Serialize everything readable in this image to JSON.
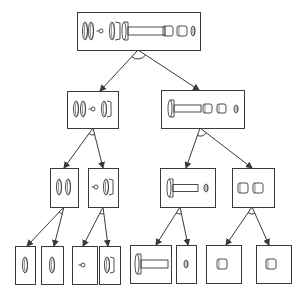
{
  "diagram": {
    "type": "assembly-decomposition-tree",
    "width": 304,
    "height": 293,
    "colors": {
      "stroke": "#3a3a3a",
      "background": "#ffffff"
    },
    "nodes": [
      {
        "id": "root",
        "level": 0,
        "x": 77,
        "y": 12,
        "w": 123,
        "h": 38,
        "parts": [
          {
            "kind": "ring",
            "cx": 85,
            "cy": 31,
            "rx": 2.5,
            "ry": 9
          },
          {
            "kind": "ring",
            "cx": 91,
            "cy": 31,
            "rx": 2.5,
            "ry": 9
          },
          {
            "kind": "dot-stem",
            "cx": 101,
            "cy": 31,
            "r": 2
          },
          {
            "kind": "ring",
            "cx": 112,
            "cy": 31,
            "rx": 2.5,
            "ry": 9
          },
          {
            "kind": "cap",
            "x": 115,
            "y": 22,
            "w": 5,
            "h": 18
          },
          {
            "kind": "bolt",
            "x": 122,
            "y": 22,
            "headW": 6,
            "h": 18,
            "shaftL": 37,
            "shaftH": 8
          },
          {
            "kind": "sleeve",
            "x": 163,
            "y": 26,
            "w": 10,
            "h": 10
          },
          {
            "kind": "sleeve",
            "x": 177,
            "y": 26,
            "w": 10,
            "h": 10
          },
          {
            "kind": "ring",
            "cx": 193,
            "cy": 31,
            "rx": 2,
            "ry": 5
          }
        ]
      },
      {
        "id": "left",
        "level": 1,
        "x": 67,
        "y": 91,
        "w": 51,
        "h": 37,
        "parts": [
          {
            "kind": "ring",
            "cx": 76,
            "cy": 109,
            "rx": 2.5,
            "ry": 8
          },
          {
            "kind": "ring",
            "cx": 83,
            "cy": 109,
            "rx": 2.5,
            "ry": 8
          },
          {
            "kind": "dot-stem",
            "cx": 93,
            "cy": 109,
            "r": 2
          },
          {
            "kind": "ring",
            "cx": 104,
            "cy": 109,
            "rx": 2.5,
            "ry": 8
          },
          {
            "kind": "cap",
            "x": 107,
            "y": 101,
            "w": 4,
            "h": 16
          }
        ]
      },
      {
        "id": "right",
        "level": 1,
        "x": 161,
        "y": 90,
        "w": 83,
        "h": 38,
        "parts": [
          {
            "kind": "bolt",
            "x": 168,
            "y": 100,
            "headW": 6,
            "h": 17,
            "shaftL": 27,
            "shaftH": 7
          },
          {
            "kind": "sleeve",
            "x": 203,
            "y": 104,
            "w": 9,
            "h": 9
          },
          {
            "kind": "sleeve",
            "x": 217,
            "y": 104,
            "w": 9,
            "h": 9
          },
          {
            "kind": "ring",
            "cx": 236,
            "cy": 109,
            "rx": 2,
            "ry": 4
          }
        ]
      },
      {
        "id": "left-a",
        "level": 2,
        "x": 50,
        "y": 168,
        "w": 28,
        "h": 39,
        "parts": [
          {
            "kind": "ring",
            "cx": 59,
            "cy": 187,
            "rx": 2.5,
            "ry": 8
          },
          {
            "kind": "ring",
            "cx": 68,
            "cy": 187,
            "rx": 2.5,
            "ry": 8
          }
        ]
      },
      {
        "id": "left-b",
        "level": 2,
        "x": 88,
        "y": 168,
        "w": 30,
        "h": 39,
        "parts": [
          {
            "kind": "dot-stem",
            "cx": 96,
            "cy": 187,
            "r": 2
          },
          {
            "kind": "ring",
            "cx": 106,
            "cy": 187,
            "rx": 2.5,
            "ry": 8
          },
          {
            "kind": "cap",
            "x": 109,
            "y": 179,
            "w": 4,
            "h": 16
          }
        ]
      },
      {
        "id": "right-c",
        "level": 2,
        "x": 160,
        "y": 168,
        "w": 55,
        "h": 39,
        "parts": [
          {
            "kind": "bolt",
            "x": 167,
            "y": 179,
            "headW": 6,
            "h": 18,
            "shaftL": 25,
            "shaftH": 7
          },
          {
            "kind": "ring",
            "cx": 206,
            "cy": 188,
            "rx": 2,
            "ry": 4
          }
        ]
      },
      {
        "id": "right-d",
        "level": 2,
        "x": 232,
        "y": 168,
        "w": 42,
        "h": 39,
        "parts": [
          {
            "kind": "sleeve",
            "x": 238,
            "y": 183,
            "w": 10,
            "h": 10
          },
          {
            "kind": "sleeve",
            "x": 253,
            "y": 183,
            "w": 10,
            "h": 10
          }
        ]
      },
      {
        "id": "leaf-1",
        "level": 3,
        "x": 15,
        "y": 246,
        "w": 20,
        "h": 38,
        "parts": [
          {
            "kind": "ring",
            "cx": 25,
            "cy": 265,
            "rx": 2.5,
            "ry": 8
          }
        ]
      },
      {
        "id": "leaf-2",
        "level": 3,
        "x": 41,
        "y": 246,
        "w": 22,
        "h": 38,
        "parts": [
          {
            "kind": "ring",
            "cx": 52,
            "cy": 265,
            "rx": 2.5,
            "ry": 8
          }
        ]
      },
      {
        "id": "leaf-3",
        "level": 3,
        "x": 72,
        "y": 246,
        "w": 25,
        "h": 38,
        "parts": [
          {
            "kind": "dot-stem",
            "cx": 83,
            "cy": 265,
            "r": 2
          }
        ]
      },
      {
        "id": "leaf-4",
        "level": 3,
        "x": 99,
        "y": 246,
        "w": 21,
        "h": 38,
        "parts": [
          {
            "kind": "ring",
            "cx": 107,
            "cy": 265,
            "rx": 2.5,
            "ry": 8
          },
          {
            "kind": "cap",
            "x": 110,
            "y": 257,
            "w": 4,
            "h": 16
          }
        ]
      },
      {
        "id": "leaf-5",
        "level": 3,
        "x": 130,
        "y": 245,
        "w": 41,
        "h": 38,
        "parts": [
          {
            "kind": "bolt",
            "x": 135,
            "y": 254,
            "headW": 6,
            "h": 20,
            "shaftL": 27,
            "shaftH": 8
          }
        ]
      },
      {
        "id": "leaf-6",
        "level": 3,
        "x": 176,
        "y": 245,
        "w": 20,
        "h": 38,
        "parts": [
          {
            "kind": "ring",
            "cx": 186,
            "cy": 264,
            "rx": 2,
            "ry": 4
          }
        ]
      },
      {
        "id": "leaf-7",
        "level": 3,
        "x": 206,
        "y": 245,
        "w": 35,
        "h": 38,
        "parts": [
          {
            "kind": "sleeve",
            "x": 217,
            "y": 259,
            "w": 10,
            "h": 10
          }
        ]
      },
      {
        "id": "leaf-8",
        "level": 3,
        "x": 256,
        "y": 245,
        "w": 35,
        "h": 38,
        "parts": [
          {
            "kind": "sleeve",
            "x": 266,
            "y": 259,
            "w": 10,
            "h": 10
          }
        ]
      }
    ],
    "edges": [
      {
        "from": "root",
        "to": "left",
        "x1": 138,
        "y1": 50,
        "x2": 100,
        "y2": 91
      },
      {
        "from": "root",
        "to": "right",
        "x1": 138,
        "y1": 50,
        "x2": 199,
        "y2": 90
      },
      {
        "from": "left",
        "to": "left-a",
        "x1": 93,
        "y1": 128,
        "x2": 64,
        "y2": 168
      },
      {
        "from": "left",
        "to": "left-b",
        "x1": 93,
        "y1": 128,
        "x2": 103,
        "y2": 168
      },
      {
        "from": "right",
        "to": "right-c",
        "x1": 200,
        "y1": 128,
        "x2": 186,
        "y2": 168
      },
      {
        "from": "right",
        "to": "right-d",
        "x1": 200,
        "y1": 128,
        "x2": 252,
        "y2": 168
      },
      {
        "from": "left-a",
        "to": "leaf-1",
        "x1": 64,
        "y1": 207,
        "x2": 27,
        "y2": 246
      },
      {
        "from": "left-a",
        "to": "leaf-2",
        "x1": 64,
        "y1": 207,
        "x2": 54,
        "y2": 246
      },
      {
        "from": "left-b",
        "to": "leaf-3",
        "x1": 103,
        "y1": 207,
        "x2": 83,
        "y2": 246
      },
      {
        "from": "left-b",
        "to": "leaf-4",
        "x1": 103,
        "y1": 207,
        "x2": 108,
        "y2": 246
      },
      {
        "from": "right-c",
        "to": "leaf-5",
        "x1": 180,
        "y1": 207,
        "x2": 156,
        "y2": 245
      },
      {
        "from": "right-c",
        "to": "leaf-6",
        "x1": 180,
        "y1": 207,
        "x2": 188,
        "y2": 245
      },
      {
        "from": "right-d",
        "to": "leaf-7",
        "x1": 252,
        "y1": 207,
        "x2": 226,
        "y2": 245
      },
      {
        "from": "right-d",
        "to": "leaf-8",
        "x1": 252,
        "y1": 207,
        "x2": 269,
        "y2": 245
      }
    ],
    "and_arcs": [
      {
        "node": "root",
        "cx": 138,
        "cy": 50,
        "r": 9
      },
      {
        "node": "left",
        "cx": 93,
        "cy": 128,
        "r": 7
      },
      {
        "node": "right",
        "cx": 200,
        "cy": 128,
        "r": 8
      },
      {
        "node": "left-a",
        "cx": 64,
        "cy": 207,
        "r": 7
      },
      {
        "node": "left-b",
        "cx": 103,
        "cy": 207,
        "r": 7
      },
      {
        "node": "right-c",
        "cx": 180,
        "cy": 207,
        "r": 7
      },
      {
        "node": "right-d",
        "cx": 252,
        "cy": 207,
        "r": 7
      }
    ]
  }
}
